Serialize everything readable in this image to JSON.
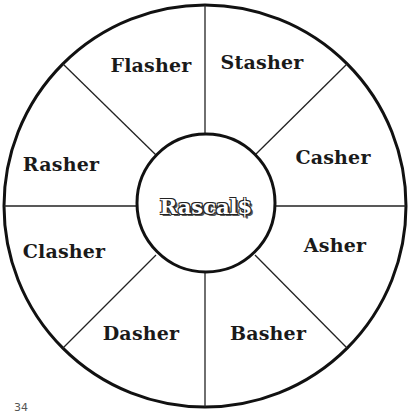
{
  "wheel": {
    "center_label": "Rascal$",
    "segments": [
      {
        "label": "Flasher"
      },
      {
        "label": "Stasher"
      },
      {
        "label": "Casher"
      },
      {
        "label": "Asher"
      },
      {
        "label": "Basher"
      },
      {
        "label": "Dasher"
      },
      {
        "label": "Clasher"
      },
      {
        "label": "Rasher"
      }
    ]
  },
  "page": {
    "number": "34"
  }
}
